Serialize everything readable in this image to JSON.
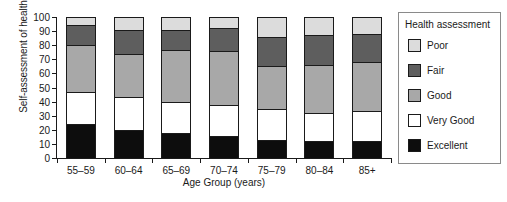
{
  "chart_data": {
    "type": "bar",
    "stacked": true,
    "stack_total": 100,
    "title": "",
    "xlabel": "Age Group (years)",
    "ylabel": "Self-assessment of health (%)",
    "categories": [
      "55–59",
      "60–64",
      "65–69",
      "70–74",
      "75–79",
      "80–84",
      "85+"
    ],
    "ylim": [
      0,
      100
    ],
    "yticks": [
      0,
      10,
      20,
      30,
      40,
      50,
      60,
      70,
      80,
      90,
      100
    ],
    "ytick_labels": [
      "0",
      "10",
      "20",
      "30",
      "40",
      "50",
      "60",
      "70",
      "80",
      "90",
      "100"
    ],
    "grid": false,
    "legend_position": "right",
    "legend_title": "Health assessment",
    "series": [
      {
        "name": "Excellent",
        "color": "#0d0d0d",
        "values": [
          24.0,
          20.0,
          17.5,
          15.5,
          12.5,
          12.0,
          12.0
        ]
      },
      {
        "name": "Very Good",
        "color": "#ffffff",
        "values": [
          23.0,
          23.5,
          22.5,
          22.0,
          22.5,
          20.0,
          21.0
        ]
      },
      {
        "name": "Good",
        "color": "#a8a8a8",
        "values": [
          33.0,
          30.5,
          36.5,
          38.5,
          30.0,
          34.0,
          35.0
        ]
      },
      {
        "name": "Fair",
        "color": "#5e5e5e",
        "values": [
          14.0,
          17.0,
          14.5,
          16.0,
          21.0,
          21.0,
          20.0
        ]
      },
      {
        "name": "Poor",
        "color": "#dcdcdc",
        "values": [
          6.0,
          9.0,
          9.0,
          8.0,
          14.0,
          13.0,
          12.0
        ]
      }
    ],
    "cumulative_tops": {
      "Excellent": [
        24.0,
        20.0,
        17.5,
        15.5,
        12.5,
        12.0,
        12.0
      ],
      "Very Good": [
        47.0,
        43.5,
        40.0,
        37.5,
        35.0,
        32.0,
        33.0
      ],
      "Good": [
        80.0,
        74.0,
        76.5,
        76.0,
        65.0,
        66.0,
        68.0
      ],
      "Fair": [
        94.0,
        91.0,
        91.0,
        92.0,
        86.0,
        87.0,
        88.0
      ],
      "Poor": [
        100.0,
        100.0,
        100.0,
        100.0,
        100.0,
        100.0,
        100.0
      ]
    }
  },
  "legend": {
    "title": "Health assessment",
    "items": [
      {
        "label": "Poor",
        "color": "#dcdcdc"
      },
      {
        "label": "Fair",
        "color": "#5e5e5e"
      },
      {
        "label": "Good",
        "color": "#a8a8a8"
      },
      {
        "label": "Very Good",
        "color": "#ffffff"
      },
      {
        "label": "Excellent",
        "color": "#0d0d0d"
      }
    ]
  }
}
